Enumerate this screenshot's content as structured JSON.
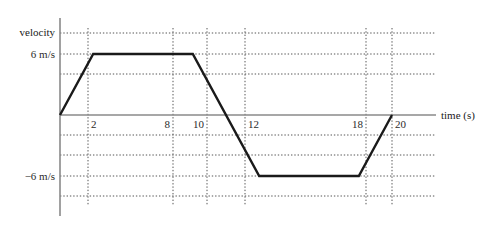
{
  "chart_data": {
    "type": "line",
    "title": "",
    "xlabel": "time (s)",
    "ylabel": "velocity",
    "xlim": [
      0,
      22
    ],
    "ylim": [
      -9,
      9
    ],
    "grid": true,
    "legend": "none",
    "x_ticks": [
      {
        "value": 2,
        "label": "2"
      },
      {
        "value": 8,
        "label": "8"
      },
      {
        "value": 10,
        "label": "10"
      },
      {
        "value": 12,
        "label": "12"
      },
      {
        "value": 18,
        "label": "18"
      },
      {
        "value": 20,
        "label": "20"
      }
    ],
    "y_ticks": [
      {
        "value": 6,
        "label": "6 m/s"
      },
      {
        "value": -6,
        "label": "−6 m/s"
      }
    ],
    "y_gridlines": [
      9,
      6,
      3,
      0,
      -3,
      -6,
      -9
    ],
    "series": [
      {
        "name": "velocity",
        "points": [
          {
            "x": 0,
            "y": 0
          },
          {
            "x": 2,
            "y": 6
          },
          {
            "x": 8,
            "y": 6
          },
          {
            "x": 12,
            "y": -6
          },
          {
            "x": 18,
            "y": -6
          },
          {
            "x": 20,
            "y": 0
          }
        ]
      }
    ],
    "colors": {
      "curve": "#1a1a1a",
      "axis": "#8a8a8a",
      "grid": "#5a5a5a",
      "text": "#1a1a1a",
      "background": "#ffffff"
    }
  },
  "axes": {
    "y_axis_caption": "velocity",
    "x_axis_caption": "time (s)"
  }
}
